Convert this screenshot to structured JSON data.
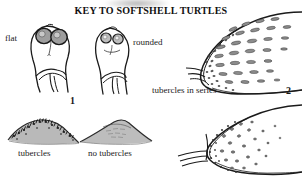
{
  "figure": {
    "title": "KEY TO SOFTSHELL TURTLES",
    "type": "dichotomous-identification-key-illustration",
    "background_color": "#ffffff",
    "ink_color": "#1a1a1a",
    "shading_color": "#9a9a9a",
    "labels": {
      "flat": "flat",
      "rounded": "rounded",
      "tubercles_in_series": "tubercles in series",
      "tubercles": "tubercles",
      "no_tubercles": "no tubercles"
    },
    "couplet_numbers": {
      "one": "1",
      "two": "2"
    },
    "panels": [
      {
        "id": "head-flat",
        "label": "flat",
        "couplet": "1",
        "description": "dorsal view of softshell turtle head with two large close-set shaded eyes, flat snout profile"
      },
      {
        "id": "head-rounded",
        "label": "rounded",
        "couplet": "1",
        "description": "dorsal view of softshell turtle head with smaller eyes and rounded snout profile"
      },
      {
        "id": "carapace-tubercles-in-series",
        "label": "tubercles in series",
        "couplet": "2",
        "description": "anterior carapace margin bearing elongate dash-like tubercles arranged in regular rows"
      },
      {
        "id": "ridge-tubercles",
        "label": "tubercles",
        "description": "cross-section of carapace ridge densely covered with pointed tubercles"
      },
      {
        "id": "ridge-no-tubercles",
        "label": "no tubercles",
        "description": "cross-section of smooth carapace ridge without tubercles"
      },
      {
        "id": "carapace-scattered-tubercles",
        "label": "",
        "description": "anterior carapace margin with small scattered rounded tubercles, not in series"
      }
    ]
  }
}
